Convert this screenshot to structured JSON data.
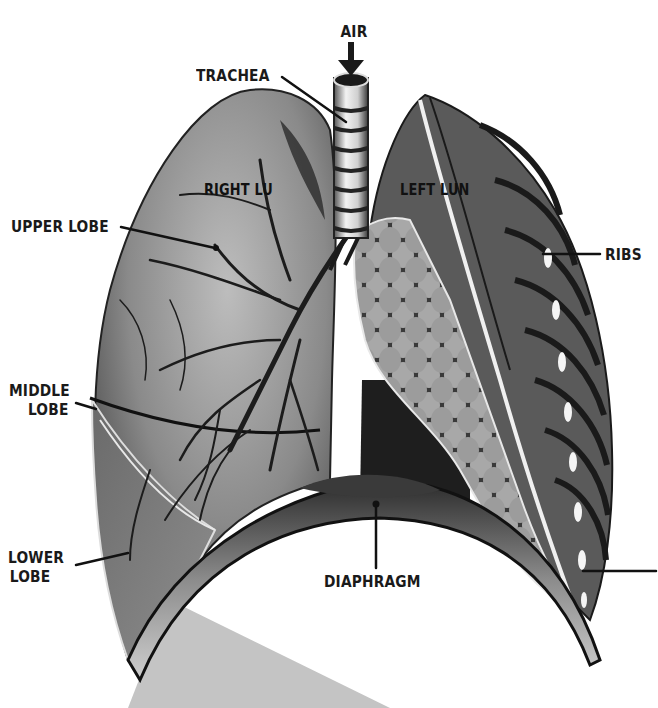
{
  "diagram": {
    "style": "monochrome halftone illustration",
    "colors": {
      "background": "#ffffff",
      "ink": "#1a1a1a",
      "lung_mid": "#7a7a7a",
      "lung_light": "#b8b8b8",
      "lung_dark": "#2e2e2e",
      "shadow_wedge": "#c4c4c4"
    },
    "labels": {
      "air": "AIR",
      "trachea": "TRACHEA",
      "right_lung": "RIGHT LU",
      "left_lung": "LEFT LUN",
      "upper_lobe": "UPPER LOBE",
      "middle_lobe_line1": "MIDDLE",
      "middle_lobe_line2": "LOBE",
      "lower_lobe_line1": "LOWER",
      "lower_lobe_line2": "LOBE",
      "ribs": "RIBS",
      "diaphragm": "DIAPHRAGM"
    },
    "parts": [
      {
        "id": "trachea",
        "label_ref": "trachea"
      },
      {
        "id": "right-lung",
        "label_ref": "right_lung",
        "lobes": [
          "upper_lobe",
          "middle_lobe",
          "lower_lobe"
        ]
      },
      {
        "id": "left-lung",
        "label_ref": "left_lung",
        "detail": "alveoli cluster cutaway"
      },
      {
        "id": "ribs",
        "label_ref": "ribs"
      },
      {
        "id": "diaphragm",
        "label_ref": "diaphragm"
      }
    ]
  }
}
